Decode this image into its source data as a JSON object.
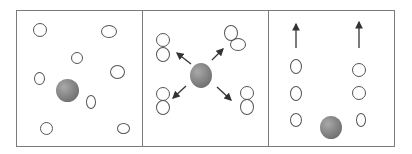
{
  "diagram": {
    "colors": {
      "border": "#7a7a7a",
      "particle_outline": "#555555",
      "sphere": "#8a8a8a",
      "arrow": "#333333"
    },
    "panels": [
      {
        "id": "panel-1",
        "label": ""
      },
      {
        "id": "panel-2",
        "label": ""
      },
      {
        "id": "panel-3",
        "label": ""
      }
    ]
  }
}
